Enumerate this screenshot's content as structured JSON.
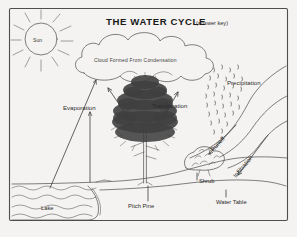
{
  "page": {
    "title_main": "THE WATER CYCLE",
    "title_sub": "(answer key)",
    "background_color": "#f4f3f1",
    "ink_color": "#4a4a4a"
  },
  "labels": {
    "sun": "Sun",
    "cloud": "Cloud Formed From Condensation",
    "evaporation": "Evaporation",
    "transpiration": "Transpiration",
    "precipitation": "Precipitation",
    "runoff": "Runoff",
    "infiltration": "Infiltration",
    "shrub": "Shrub",
    "pitch_pine": "Pitch Pine",
    "lake": "Lake",
    "water_table": "Water Table"
  },
  "diagram_elements": [
    "sun-with-rays",
    "cumulus-cloud",
    "rain-drops",
    "pitch-pine-tree",
    "shrub",
    "lake-water-waves",
    "hillside-terrain",
    "water-table-line",
    "evaporation-arrow",
    "transpiration-arrows",
    "runoff-arrow",
    "infiltration-arrow"
  ]
}
